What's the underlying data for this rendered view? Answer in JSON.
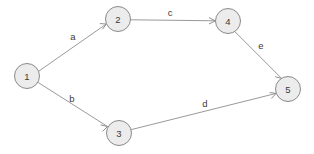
{
  "diagram": {
    "type": "directed-graph",
    "background_color": "#ffffff",
    "node_fill_color": "#ececec",
    "node_stroke_color": "#8a8a8a",
    "edge_color": "#9a9a9a",
    "text_color": "#3a3a3a",
    "nodes": [
      {
        "id": "1",
        "label": "1",
        "cx": 27,
        "cy": 76,
        "r": 12.5
      },
      {
        "id": "2",
        "label": "2",
        "cx": 118,
        "cy": 19,
        "r": 12.5
      },
      {
        "id": "3",
        "label": "3",
        "cx": 119,
        "cy": 133,
        "r": 12.5
      },
      {
        "id": "4",
        "label": "4",
        "cx": 228,
        "cy": 21,
        "r": 12.5
      },
      {
        "id": "5",
        "label": "5",
        "cx": 288,
        "cy": 89,
        "r": 12.5
      }
    ],
    "edges": [
      {
        "id": "a",
        "label": "a",
        "from": "1",
        "to": "2",
        "x1": 38.6,
        "y1": 71.3,
        "x2": 106.3,
        "y2": 24.0,
        "label_x": 73,
        "label_y": 36
      },
      {
        "id": "b",
        "label": "b",
        "from": "1",
        "to": "3",
        "x1": 37.9,
        "y1": 82.3,
        "x2": 107.5,
        "y2": 126.5,
        "label_x": 72,
        "label_y": 98
      },
      {
        "id": "c",
        "label": "c",
        "from": "2",
        "to": "4",
        "x1": 130.5,
        "y1": 19.8,
        "x2": 215.4,
        "y2": 20.8,
        "label_x": 170,
        "label_y": 12
      },
      {
        "id": "d",
        "label": "d",
        "from": "3",
        "to": "5",
        "x1": 131.3,
        "y1": 129.6,
        "x2": 276.2,
        "y2": 93.4,
        "label_x": 205,
        "label_y": 103
      },
      {
        "id": "e",
        "label": "e",
        "from": "4",
        "to": "5",
        "x1": 234.8,
        "y1": 31.6,
        "x2": 281.6,
        "y2": 78.4,
        "label_x": 261,
        "label_y": 45
      }
    ]
  }
}
